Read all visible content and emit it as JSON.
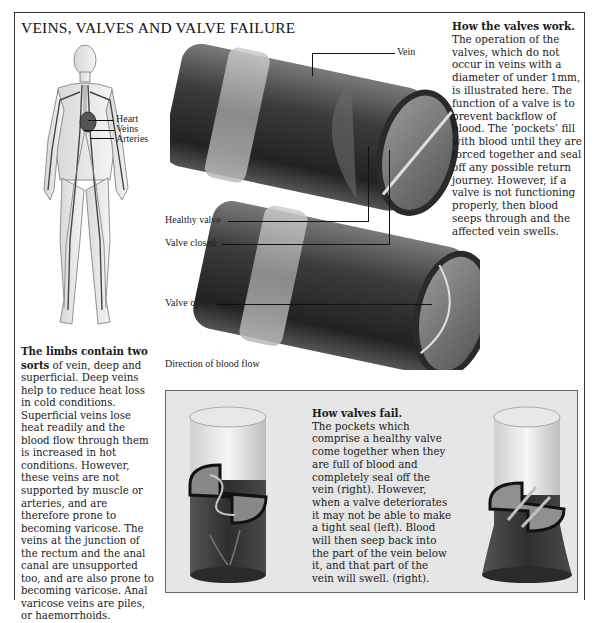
{
  "title": "VEINS, VALVES AND VALVE FAILURE",
  "body_figure": {
    "labels": [
      "Heart",
      "Veins",
      "Arteries"
    ]
  },
  "main_diagram": {
    "labels": {
      "vein": "Vein",
      "healthy_valve": "Healthy valve",
      "valve_closed": "Valve closed",
      "valve_open": "Valve open",
      "direction": "Direction of blood flow"
    }
  },
  "how_valves_work": {
    "heading": "How the valves work.",
    "body": "The operation of the valves, which do not occur in veins with a diameter of under 1mm, is illustrated here. The function of a valve is to prevent backflow of blood. The ‘pockets’ fill with blood until they are forced together and seal off any possible return journey. However, if a valve is not functioning properly, then blood seeps through and the affected vein swells."
  },
  "limbs": {
    "heading": "The limbs contain two sorts",
    "body": " of vein, deep and superficial. Deep veins help to reduce heat loss in cold conditions. Superficial veins lose heat readily and the blood flow through them is increased in hot conditions. However, these veins are not supported by muscle or arteries, and are therefore prone to becoming varicose. The veins at the junction of the rectum and the anal canal are unsupported too, and are also prone to becoming varicose. Anal varicose veins are piles, or haemorrhoids."
  },
  "how_valves_fail": {
    "heading": "How valves fail.",
    "body": "The pockets which comprise a healthy valve come together when they are full of blood and completely seal off the vein (right). However, when a valve deteriorates it may not be able to make a tight seal (left). Blood will then seep back into the part of the vein below it, and that part of the vein will swell. (right)."
  },
  "colors": {
    "ink": "#1a1a1a",
    "panel_bg": "#e6e6e6",
    "vein_dark": "#3a3a3a",
    "vein_light": "#b5b5b5"
  }
}
